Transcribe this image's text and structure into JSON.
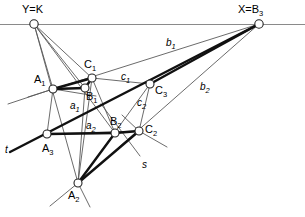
{
  "figure": {
    "type": "geometric-line-diagram",
    "width": 305,
    "height": 217,
    "stroke_thin": "#5a5a5a",
    "stroke_thick": "#111111",
    "axis_color": "#8a8a8a",
    "node_fill": "#ffffff",
    "node_stroke": "#222222"
  },
  "points": [
    {
      "id": "YK",
      "x": 34,
      "y": 24,
      "r": 4.2,
      "label": "Y=K",
      "sub": "",
      "lx": 22,
      "ly": 4
    },
    {
      "id": "XB3",
      "x": 259,
      "y": 24,
      "r": 4.2,
      "label": "X=B",
      "sub": "3",
      "lx": 238,
      "ly": 4
    },
    {
      "id": "A1",
      "x": 53,
      "y": 89,
      "r": 4.0,
      "label": "A",
      "sub": "1",
      "lx": 34,
      "ly": 74
    },
    {
      "id": "B1",
      "x": 85,
      "y": 88,
      "r": 4.0,
      "label": "B",
      "sub": "1",
      "lx": 86,
      "ly": 91
    },
    {
      "id": "C1",
      "x": 92,
      "y": 78,
      "r": 4.0,
      "label": "C",
      "sub": "1",
      "lx": 84,
      "ly": 59
    },
    {
      "id": "C3",
      "x": 150,
      "y": 84,
      "r": 4.0,
      "label": "C",
      "sub": "3",
      "lx": 155,
      "ly": 85
    },
    {
      "id": "A3",
      "x": 47,
      "y": 134,
      "r": 4.0,
      "label": "A",
      "sub": "3",
      "lx": 42,
      "ly": 143
    },
    {
      "id": "B2",
      "x": 115,
      "y": 133,
      "r": 4.0,
      "label": "B",
      "sub": "2",
      "lx": 110,
      "ly": 116
    },
    {
      "id": "C2",
      "x": 139,
      "y": 131,
      "r": 4.0,
      "label": "C",
      "sub": "2",
      "lx": 145,
      "ly": 124
    },
    {
      "id": "A2",
      "x": 78,
      "y": 183,
      "r": 4.0,
      "label": "A",
      "sub": "2",
      "lx": 68,
      "ly": 190
    }
  ],
  "line_labels": [
    {
      "id": "b1",
      "label": "b",
      "sub": "1",
      "x": 166,
      "y": 38
    },
    {
      "id": "b2",
      "label": "b",
      "sub": "2",
      "x": 200,
      "y": 82
    },
    {
      "id": "c1",
      "label": "c",
      "sub": "1",
      "x": 121,
      "y": 72
    },
    {
      "id": "c2",
      "label": "c",
      "sub": "2",
      "x": 137,
      "y": 98
    },
    {
      "id": "a1",
      "label": "a",
      "sub": "1",
      "x": 70,
      "y": 101
    },
    {
      "id": "a2",
      "label": "a",
      "sub": "2",
      "x": 86,
      "y": 121
    },
    {
      "id": "t",
      "label": "t",
      "sub": "",
      "x": 5,
      "y": 145
    },
    {
      "id": "s",
      "label": "s",
      "sub": "",
      "x": 142,
      "y": 160
    }
  ],
  "segments": {
    "axis": [
      {
        "name": "horizon-line-XY",
        "x1": 0,
        "y1": 24.5,
        "x2": 305,
        "y2": 24.5
      }
    ],
    "thin": [
      {
        "name": "ray-YK-to-A1",
        "x1": 34,
        "y1": 24,
        "x2": 53,
        "y2": 89
      },
      {
        "name": "ray-YK-to-B1",
        "x1": 34,
        "y1": 24,
        "x2": 85,
        "y2": 88
      },
      {
        "name": "ray-YK-to-C1",
        "x1": 34,
        "y1": 24,
        "x2": 92,
        "y2": 78
      },
      {
        "name": "ray-YK-to-B2",
        "x1": 34,
        "y1": 24,
        "x2": 115,
        "y2": 133
      },
      {
        "name": "ray-YK-to-A2",
        "x1": 34,
        "y1": 24,
        "x2": 78,
        "y2": 183
      },
      {
        "name": "line-b1-XB3-to-A1",
        "x1": 259,
        "y1": 24,
        "x2": 28,
        "y2": 97
      },
      {
        "name": "line-b2-XB3-to-C2ext",
        "x1": 259,
        "y1": 24,
        "x2": 118,
        "y2": 148
      },
      {
        "name": "line-c1-C1-to-C3",
        "x1": 92,
        "y1": 78,
        "x2": 150,
        "y2": 84
      },
      {
        "name": "line-c2-C3-to-C2",
        "x1": 150,
        "y1": 84,
        "x2": 139,
        "y2": 131
      },
      {
        "name": "line-a2-A3-to-B2",
        "x1": 47,
        "y1": 134,
        "x2": 115,
        "y2": 133
      },
      {
        "name": "line-A1-to-A3",
        "x1": 53,
        "y1": 89,
        "x2": 47,
        "y2": 134
      },
      {
        "name": "line-C1-to-A2",
        "x1": 92,
        "y1": 78,
        "x2": 78,
        "y2": 183
      },
      {
        "name": "line-C3-to-A2",
        "x1": 150,
        "y1": 84,
        "x2": 78,
        "y2": 183
      },
      {
        "name": "line-A3-to-C2",
        "x1": 47,
        "y1": 134,
        "x2": 139,
        "y2": 131
      },
      {
        "name": "line-t-left-tail",
        "x1": 8,
        "y1": 104,
        "x2": 53,
        "y2": 89
      },
      {
        "name": "line-s-through-B2",
        "x1": 101,
        "y1": 104,
        "x2": 140,
        "y2": 156
      },
      {
        "name": "line-through-C2-lowright",
        "x1": 139,
        "y1": 131,
        "x2": 167,
        "y2": 147
      },
      {
        "name": "line-through-C2-upleft",
        "x1": 139,
        "y1": 131,
        "x2": 122,
        "y2": 115
      },
      {
        "name": "line-through-A2-lowleft",
        "x1": 78,
        "y1": 183,
        "x2": 50,
        "y2": 206
      },
      {
        "name": "line-through-A2-lowright",
        "x1": 78,
        "y1": 183,
        "x2": 90,
        "y2": 207
      },
      {
        "name": "line-B1-to-A2",
        "x1": 85,
        "y1": 88,
        "x2": 78,
        "y2": 183
      },
      {
        "name": "line-C1-to-B2",
        "x1": 92,
        "y1": 78,
        "x2": 115,
        "y2": 133
      },
      {
        "name": "line-A1-right-tail",
        "x1": 53,
        "y1": 89,
        "x2": 96,
        "y2": 96
      }
    ],
    "thick": [
      {
        "name": "seg-A1-B1",
        "x1": 53,
        "y1": 89,
        "x2": 85,
        "y2": 88
      },
      {
        "name": "seg-A1-C1",
        "x1": 53,
        "y1": 89,
        "x2": 92,
        "y2": 78
      },
      {
        "name": "seg-B1-C1",
        "x1": 85,
        "y1": 88,
        "x2": 92,
        "y2": 78
      },
      {
        "name": "seg-t-A3-to-XB3",
        "x1": 10,
        "y1": 152,
        "x2": 259,
        "y2": 24
      },
      {
        "name": "seg-A2-B2",
        "x1": 78,
        "y1": 183,
        "x2": 115,
        "y2": 133
      },
      {
        "name": "seg-A2-C2",
        "x1": 78,
        "y1": 183,
        "x2": 139,
        "y2": 131
      },
      {
        "name": "seg-B2-C2",
        "x1": 115,
        "y1": 133,
        "x2": 139,
        "y2": 131
      },
      {
        "name": "seg-B2-A3",
        "x1": 115,
        "y1": 133,
        "x2": 47,
        "y2": 134
      },
      {
        "name": "seg-C3-XB3",
        "x1": 150,
        "y1": 84,
        "x2": 259,
        "y2": 24
      }
    ]
  }
}
